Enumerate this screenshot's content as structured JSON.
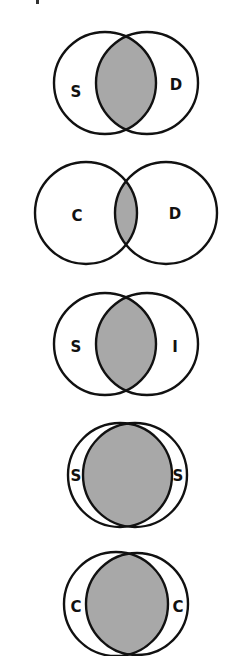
{
  "figure": {
    "type": "venn-overlap-comparison",
    "fill_color": "#a8a8a8",
    "stroke_color": "#111111",
    "diagrams": [
      {
        "id": "s-d",
        "left_label": "S",
        "right_label": "D",
        "overlap": "moderate",
        "left_circle": {
          "cx": 105,
          "cy": 83,
          "r": 51
        },
        "right_circle": {
          "cx": 147,
          "cy": 83,
          "r": 51
        },
        "left_label_pos": {
          "x": 76,
          "y": 92
        },
        "right_label_pos": {
          "x": 176,
          "y": 85
        }
      },
      {
        "id": "c-d",
        "left_label": "C",
        "right_label": "D",
        "overlap": "small",
        "left_circle": {
          "cx": 86,
          "cy": 213,
          "r": 51
        },
        "right_circle": {
          "cx": 166,
          "cy": 213,
          "r": 51
        },
        "left_label_pos": {
          "x": 77,
          "y": 216
        },
        "right_label_pos": {
          "x": 175,
          "y": 214
        }
      },
      {
        "id": "s-i",
        "left_label": "S",
        "right_label": "I",
        "overlap": "moderate",
        "left_circle": {
          "cx": 105,
          "cy": 344,
          "r": 51
        },
        "right_circle": {
          "cx": 147,
          "cy": 344,
          "r": 51
        },
        "left_label_pos": {
          "x": 76,
          "y": 347
        },
        "right_label_pos": {
          "x": 175,
          "y": 347
        }
      },
      {
        "id": "s-s",
        "left_label": "S",
        "right_label": "S",
        "overlap": "large",
        "left_circle": {
          "cx": 120,
          "cy": 475,
          "r": 52
        },
        "right_circle": {
          "cx": 135,
          "cy": 475,
          "r": 52
        },
        "left_label_pos": {
          "x": 76,
          "y": 476
        },
        "right_label_pos": {
          "x": 178,
          "y": 476
        }
      },
      {
        "id": "c-c",
        "left_label": "C",
        "right_label": "C",
        "overlap": "large",
        "left_circle": {
          "cx": 116,
          "cy": 604,
          "r": 52
        },
        "right_circle": {
          "cx": 137,
          "cy": 604,
          "r": 51
        },
        "left_label_pos": {
          "x": 76,
          "y": 607
        },
        "right_label_pos": {
          "x": 178,
          "y": 607
        }
      }
    ]
  }
}
